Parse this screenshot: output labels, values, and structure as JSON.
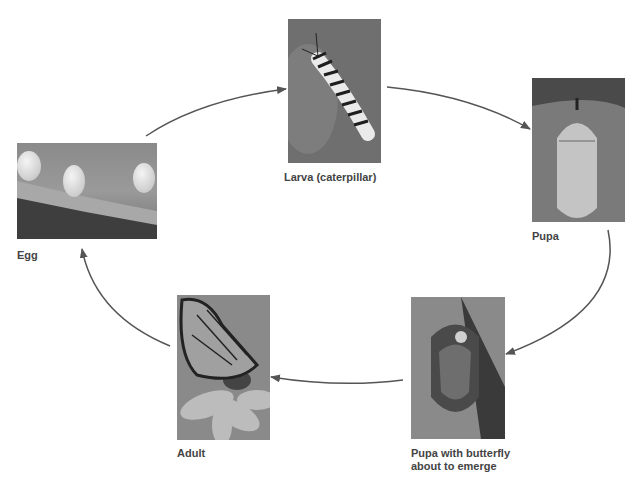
{
  "diagram": {
    "stages": [
      {
        "id": "egg",
        "label": "Egg"
      },
      {
        "id": "larva",
        "label": "Larva (caterpillar)"
      },
      {
        "id": "pupa",
        "label": "Pupa"
      },
      {
        "id": "pupa_emerge",
        "label_line1": "Pupa with butterfly",
        "label_line2": "about to emerge"
      },
      {
        "id": "adult",
        "label": "Adult"
      }
    ],
    "arrow_color": "#555555"
  }
}
